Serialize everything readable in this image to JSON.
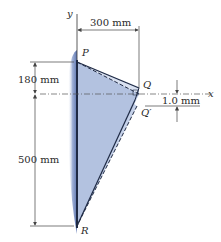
{
  "diagram": {
    "type": "mechanics-deformation-figure",
    "axes": {
      "x_label": "x",
      "y_label": "y"
    },
    "points": {
      "P": "P",
      "Q": "Q",
      "Q_prime": "Q′",
      "R": "R"
    },
    "dimensions": {
      "horizontal_PQ": "300 mm",
      "vertical_P_to_x": "180 mm",
      "vertical_x_to_R": "500 mm",
      "displacement_Q": "1.0 mm"
    },
    "colors": {
      "plate_fill": "#b9c6e2",
      "plate_edge": "#1f2a44",
      "wall_shade": "#7d93c4",
      "dimension_line": "#444444"
    }
  }
}
